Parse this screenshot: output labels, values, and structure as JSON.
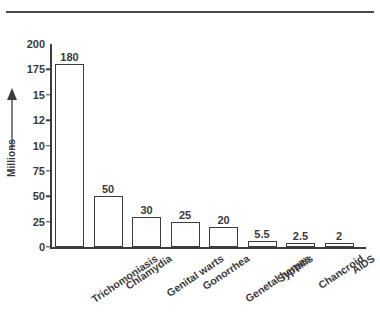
{
  "chart_data": {
    "type": "bar",
    "title": "",
    "xlabel": "",
    "ylabel": "Millions",
    "ylim": [
      0,
      200
    ],
    "grid": false,
    "legend": null,
    "categories": [
      "Trichomoniasis",
      "Chlamydia",
      "Genital warts",
      "Gonorrhea",
      "Genetal herpes",
      "Syphilis",
      "Chancroid",
      "AIDS"
    ],
    "values": [
      180,
      50,
      30,
      25,
      20,
      5.5,
      2.5,
      2
    ],
    "value_labels": [
      "180",
      "50",
      "30",
      "25",
      "20",
      "5.5",
      "2.5",
      "2"
    ],
    "y_ticks": [
      {
        "label": "200",
        "value": 200
      },
      {
        "label": "175",
        "value": 175
      },
      {
        "label": "15",
        "value": 150
      },
      {
        "label": "12",
        "value": 125
      },
      {
        "label": "10",
        "value": 100
      },
      {
        "label": "75",
        "value": 75
      },
      {
        "label": "50",
        "value": 50
      },
      {
        "label": "25",
        "value": 25
      },
      {
        "label": "0",
        "value": 0
      }
    ]
  },
  "axis": {
    "y_title": "Millions",
    "arrow_name": "up-arrow-icon"
  },
  "colors": {
    "ink": "#3c3c3c",
    "text": "#3a3a3a",
    "bar_fill": "#ffffff",
    "rule": "#4a4a4a",
    "background": "#ffffff"
  }
}
